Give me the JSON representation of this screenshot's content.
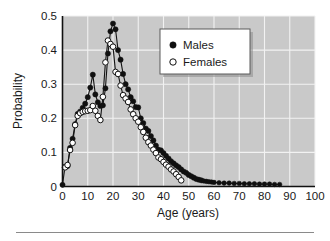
{
  "chart_data": {
    "type": "line",
    "title": "",
    "subtitle": "",
    "xlabel": "Age (years)",
    "ylabel": "Probability",
    "xlim": [
      0,
      100
    ],
    "ylim": [
      0,
      0.5
    ],
    "xticks": [
      "0",
      "10",
      "20",
      "30",
      "40",
      "50",
      "60",
      "70",
      "80",
      "90",
      "100"
    ],
    "xtick_values": [
      0,
      10,
      20,
      30,
      40,
      50,
      60,
      70,
      80,
      90,
      100
    ],
    "yticks": [
      "0",
      "0.1",
      "0.2",
      "0.3",
      "0.4",
      "0.5"
    ],
    "ytick_values": [
      0,
      0.1,
      0.2,
      0.3,
      0.4,
      0.5
    ],
    "grid": true,
    "legend_position": "upper-right",
    "legend_entries": [
      {
        "label": "Males",
        "marker": "filled-circle",
        "color": "#101010"
      },
      {
        "label": "Females",
        "marker": "open-circle",
        "color": "#ffffff"
      }
    ],
    "plot_background_color": "#c9c9c9",
    "gridline_color": "#f2f2f2",
    "series": [
      {
        "name": "Males",
        "marker": "filled-circle",
        "x": [
          0,
          1,
          2,
          3,
          4,
          5,
          6,
          7,
          8,
          9,
          10,
          11,
          12,
          13,
          14,
          15,
          16,
          17,
          18,
          19,
          20,
          21,
          22,
          23,
          24,
          25,
          26,
          27,
          28,
          29,
          30,
          31,
          32,
          33,
          34,
          35,
          36,
          37,
          38,
          39,
          40,
          41,
          42,
          43,
          44,
          45,
          46,
          47,
          48,
          49,
          50,
          51,
          52,
          53,
          54,
          55,
          56,
          57,
          58,
          59,
          60,
          62,
          64,
          66,
          68,
          70,
          72,
          74,
          76,
          78,
          80,
          82,
          84,
          86
        ],
        "values": [
          0.005,
          0.058,
          0.06,
          0.113,
          0.14,
          0.183,
          0.213,
          0.22,
          0.231,
          0.243,
          0.262,
          0.29,
          0.328,
          0.27,
          0.247,
          0.236,
          0.238,
          0.288,
          0.39,
          0.455,
          0.478,
          0.461,
          0.4,
          0.372,
          0.33,
          0.3,
          0.285,
          0.262,
          0.25,
          0.233,
          0.232,
          0.2,
          0.186,
          0.17,
          0.163,
          0.148,
          0.135,
          0.12,
          0.108,
          0.106,
          0.098,
          0.09,
          0.082,
          0.074,
          0.068,
          0.062,
          0.057,
          0.05,
          0.044,
          0.04,
          0.034,
          0.03,
          0.026,
          0.022,
          0.02,
          0.018,
          0.016,
          0.015,
          0.014,
          0.013,
          0.012,
          0.011,
          0.01,
          0.01,
          0.009,
          0.009,
          0.008,
          0.008,
          0.008,
          0.007,
          0.007,
          0.007,
          0.006,
          0.006
        ]
      },
      {
        "name": "Females",
        "marker": "open-circle",
        "x": [
          1,
          2,
          3,
          4,
          5,
          6,
          7,
          8,
          9,
          10,
          11,
          12,
          13,
          14,
          15,
          16,
          17,
          18,
          19,
          20,
          21,
          22,
          23,
          24,
          25,
          26,
          27,
          28,
          29,
          30,
          31,
          32,
          33,
          34,
          35,
          36,
          37,
          38,
          39,
          40,
          41,
          42,
          43,
          44,
          45,
          46,
          47
        ],
        "values": [
          0.056,
          0.063,
          0.107,
          0.128,
          0.18,
          0.207,
          0.215,
          0.219,
          0.221,
          0.222,
          0.224,
          0.236,
          0.222,
          0.207,
          0.195,
          0.263,
          0.364,
          0.428,
          0.418,
          0.41,
          0.336,
          0.33,
          0.296,
          0.268,
          0.258,
          0.248,
          0.226,
          0.212,
          0.2,
          0.19,
          0.174,
          0.16,
          0.143,
          0.13,
          0.12,
          0.108,
          0.098,
          0.085,
          0.08,
          0.072,
          0.064,
          0.058,
          0.05,
          0.044,
          0.036,
          0.028,
          0.018
        ]
      }
    ]
  },
  "axes": {
    "xlabel": "Age (years)",
    "ylabel": "Probability"
  },
  "legend": {
    "males_label": "Males",
    "females_label": "Females"
  }
}
